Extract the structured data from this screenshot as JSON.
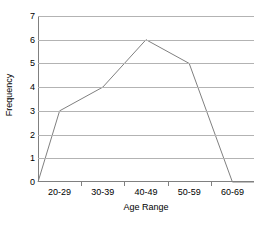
{
  "chart_data": {
    "type": "line",
    "title": "",
    "xlabel": "Age Range",
    "ylabel": "Frequency",
    "categories": [
      "20-29",
      "30-39",
      "40-49",
      "50-59",
      "60-69"
    ],
    "values": [
      3,
      4,
      6,
      5,
      0
    ],
    "series": [
      {
        "name": "Frequency",
        "values": [
          3,
          4,
          6,
          5,
          0
        ]
      }
    ],
    "baseline_start": 0,
    "baseline_end": 0,
    "ylim": [
      0,
      7
    ],
    "yticks": [
      0,
      1,
      2,
      3,
      4,
      5,
      6,
      7
    ],
    "ytick_labels": [
      "0",
      "1",
      "2",
      "3",
      "4",
      "5",
      "6",
      "7"
    ],
    "grid": "horizontal",
    "legend": "none",
    "line_color": "#808080",
    "grid_color": "#b3b3b3",
    "axis_color": "#808080",
    "background": "#ffffff"
  }
}
